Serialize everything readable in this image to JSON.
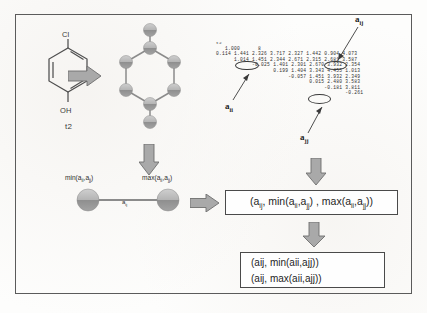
{
  "figure": {
    "frame_color": "#5b5b5b",
    "background": "#fdfdfc"
  },
  "structure": {
    "name": "4-chlorophenol",
    "substituent_top": "Cl",
    "substituent_bottom": "OH",
    "caption": "t2"
  },
  "graph": {
    "label": "molecular-graph",
    "node_count": 8,
    "ring_size": 6
  },
  "matrix": {
    "title": "t2",
    "header": "   1.000      8",
    "rows": [
      "0.114 1.441 2.326 3.717 2.327 1.442 0.904 4.073",
      "      1.014 1.451 2.344 2.671 2.315 2.681 3.587",
      "            -0.025 1.401 2.301 2.670 3.932 2.354",
      "                   0.199 1.404 3.343 4.455 1.013",
      "                        -0.057 1.451 3.932 2.349",
      "                               0.015 2.480 3.583",
      "                                    -0.181 3.811",
      "                                           -0.261"
    ],
    "annotations": [
      {
        "name": "a_ij",
        "base": "a",
        "sub": "ij"
      },
      {
        "name": "a_ii",
        "base": "a",
        "sub": "ii"
      },
      {
        "name": "a_jj",
        "base": "a",
        "sub": "jj"
      }
    ],
    "circled_values": [
      "1.014",
      "2.315",
      "0.015"
    ]
  },
  "pair": {
    "min_label_base": "min(a",
    "min_label": "min(aᵢᵢ,aⱼⱼ)",
    "max_label": "max(aᵢᵢ,aⱼⱼ)",
    "bond_label": "a",
    "bond_sub": "ij",
    "min_text_main": "min(a",
    "max_text_main": "max(a"
  },
  "tuple_box": {
    "text": "(a",
    "full": "(aᵢⱼ, min(aᵢᵢ,aⱼⱼ) , max(aᵢᵢ,aⱼⱼ))"
  },
  "final_box": {
    "line1": "(aij, min(aii,ajj))",
    "line2": "(aij, max(aii,ajj))"
  },
  "arrows": {
    "structure_to_graph": "arrow-right",
    "graph_to_pair": "arrow-down",
    "pair_to_tuple": "arrow-right",
    "matrix_to_tuple": "arrow-down",
    "tuple_to_final": "arrow-down"
  }
}
